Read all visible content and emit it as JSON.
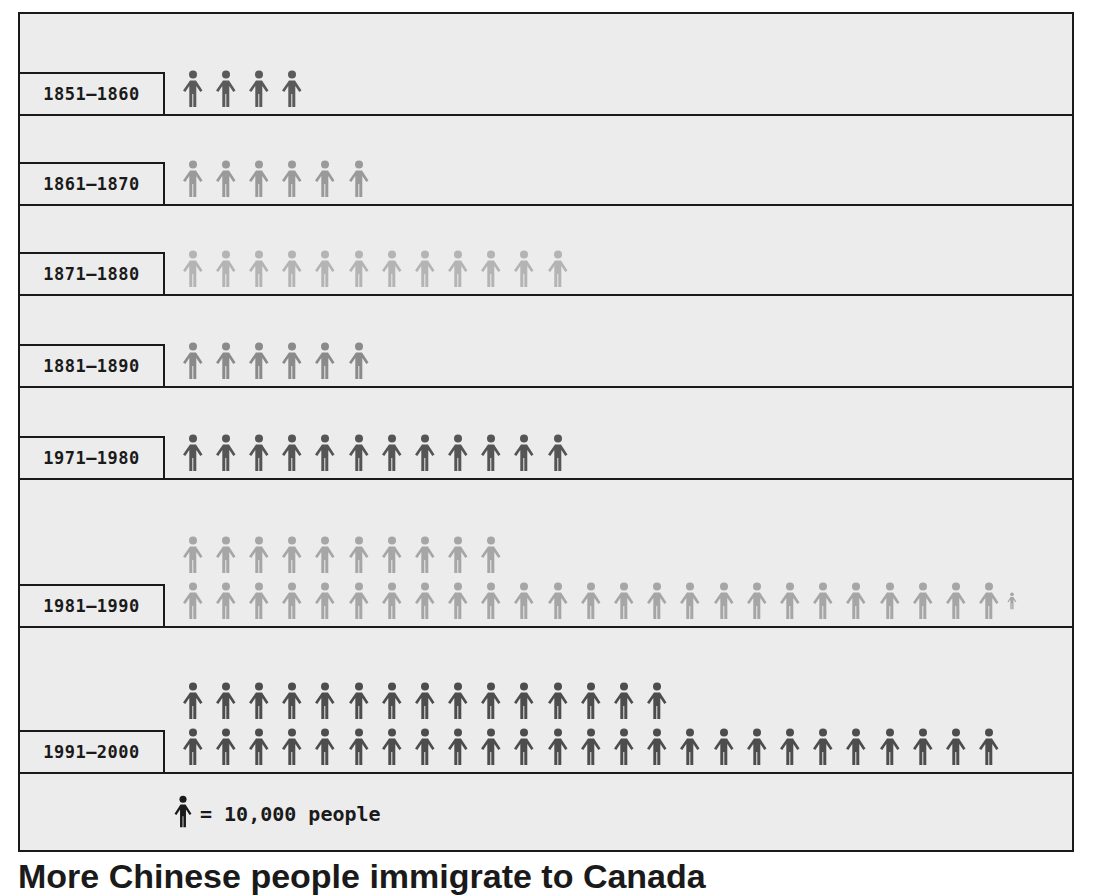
{
  "chart_data": {
    "type": "pictogram",
    "title": "",
    "unit": "1 figure = 10,000 people",
    "categories": [
      "1851-1860",
      "1861-1870",
      "1871-1880",
      "1881-1890",
      "1971-1980",
      "1981-1990",
      "1991-2000"
    ],
    "values": [
      40000,
      60000,
      120000,
      60000,
      120000,
      355000,
      400000
    ],
    "icon_counts": [
      4,
      6,
      12,
      6,
      12,
      35.5,
      40
    ],
    "icon_rows": [
      [
        4
      ],
      [
        6
      ],
      [
        12
      ],
      [
        6
      ],
      [
        12
      ],
      [
        10,
        25.5
      ],
      [
        15,
        25
      ]
    ],
    "icon_colors": [
      "#5a5a5a",
      "#9a9a9a",
      "#b4b4b4",
      "#8a8a8a",
      "#555555",
      "#a6a6a6",
      "#4d4d4d"
    ],
    "xlabel": "",
    "ylabel": "",
    "legend": "= 10,000 people"
  },
  "rows": [
    {
      "label": "1851–1860",
      "count": 4
    },
    {
      "label": "1861–1870",
      "count": 6
    },
    {
      "label": "1871–1880",
      "count": 12
    },
    {
      "label": "1881–1890",
      "count": 6
    },
    {
      "label": "1971–1980",
      "count": 12
    },
    {
      "label": "1981–1990",
      "count": 35.5
    },
    {
      "label": "1991–2000",
      "count": 40
    }
  ],
  "legend": {
    "icon": "person-icon",
    "text": "= 10,000 people"
  },
  "footer": {
    "title": "More Chinese people immigrate to Canada"
  }
}
